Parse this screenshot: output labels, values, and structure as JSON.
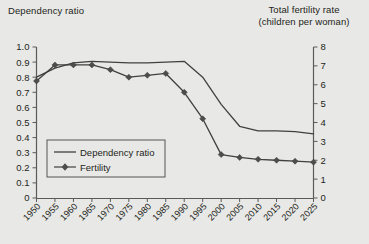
{
  "header": {
    "left_title": "Dependency ratio",
    "right_title_line1": "Total fertility rate",
    "right_title_line2": "(children per woman)"
  },
  "legend": {
    "items": [
      {
        "label": "Dependency ratio",
        "marker": "none",
        "color": "#404040"
      },
      {
        "label": "Fertility",
        "marker": "diamond",
        "color": "#4d4d4d"
      }
    ]
  },
  "axes": {
    "left_ticks": [
      "1.0",
      "0.9",
      "0.8",
      "0.7",
      "0.6",
      "0.5",
      "0.4",
      "0.3",
      "0.2",
      "0.1",
      "0"
    ],
    "right_ticks": [
      "8",
      "7",
      "6",
      "5",
      "4",
      "3",
      "2",
      "1",
      "0"
    ],
    "x_ticks": [
      "1950",
      "1955",
      "1960",
      "1965",
      "1970",
      "1975",
      "1980",
      "1985",
      "1990",
      "1995",
      "2000",
      "2005",
      "2010",
      "2015",
      "2020",
      "2025"
    ]
  },
  "colors": {
    "background": "#e8e8e6",
    "axis": "#5a5a5a",
    "line": "#404040",
    "marker": "#4d4d4d",
    "text": "#231f20"
  },
  "chart_data": {
    "type": "line",
    "title": "",
    "xlabel": "",
    "ylabel": "Dependency ratio",
    "y2label": "Total fertility rate (children per woman)",
    "x": [
      1950,
      1955,
      1960,
      1965,
      1970,
      1975,
      1980,
      1985,
      1990,
      1995,
      2000,
      2005,
      2010,
      2015,
      2020,
      2025
    ],
    "ylim": [
      0,
      1.0
    ],
    "y2lim": [
      0,
      8
    ],
    "grid": false,
    "legend_position": "lower-left",
    "series": [
      {
        "name": "Dependency ratio",
        "axis": "left",
        "marker": "none",
        "values": [
          0.8,
          0.86,
          0.895,
          0.905,
          0.9,
          0.895,
          0.895,
          0.9,
          0.905,
          0.8,
          0.62,
          0.475,
          0.445,
          0.445,
          0.44,
          0.425
        ]
      },
      {
        "name": "Fertility",
        "axis": "right",
        "marker": "diamond",
        "values": [
          6.2,
          7.05,
          7.05,
          7.05,
          6.8,
          6.4,
          6.5,
          6.6,
          5.6,
          4.2,
          2.3,
          2.15,
          2.05,
          2.0,
          1.95,
          1.9
        ]
      }
    ]
  }
}
